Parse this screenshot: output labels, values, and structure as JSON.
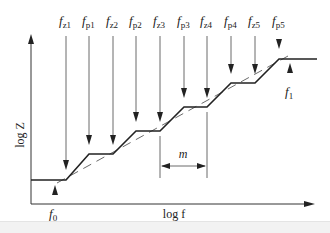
{
  "diagram": {
    "axes": {
      "y_label": "log Z",
      "x_label": "log f"
    },
    "frequency_markers": [
      {
        "label": "f",
        "sub": "z1",
        "x": 66,
        "arrow_end_y": 168
      },
      {
        "label": "f",
        "sub": "p1",
        "x": 89,
        "arrow_end_y": 143
      },
      {
        "label": "f",
        "sub": "z2",
        "x": 113,
        "arrow_end_y": 143
      },
      {
        "label": "f",
        "sub": "p2",
        "x": 136,
        "arrow_end_y": 120
      },
      {
        "label": "f",
        "sub": "z3",
        "x": 160,
        "arrow_end_y": 120
      },
      {
        "label": "f",
        "sub": "p3",
        "x": 184,
        "arrow_end_y": 96
      },
      {
        "label": "f",
        "sub": "z4",
        "x": 207,
        "arrow_end_y": 96
      },
      {
        "label": "f",
        "sub": "p4",
        "x": 231,
        "arrow_end_y": 72
      },
      {
        "label": "f",
        "sub": "z5",
        "x": 255,
        "arrow_end_y": 72
      },
      {
        "label": "f",
        "sub": "p5",
        "x": 279,
        "arrow_end_y": 48
      }
    ],
    "corner_markers": [
      {
        "label": "f",
        "sub": "0"
      },
      {
        "label": "f",
        "sub": "1"
      }
    ],
    "interval_label": "m",
    "colors": {
      "line": "#222222",
      "thin": "#444444"
    }
  }
}
